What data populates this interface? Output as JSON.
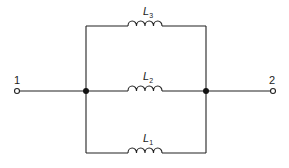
{
  "diagram": {
    "type": "parallel inductor circuit",
    "terminals": [
      {
        "id": "terminal-1",
        "label": "1"
      },
      {
        "id": "terminal-2",
        "label": "2"
      }
    ],
    "inductors": [
      {
        "name": "L",
        "sub": "3",
        "branch": "top"
      },
      {
        "name": "L",
        "sub": "2",
        "branch": "middle"
      },
      {
        "name": "L",
        "sub": "1",
        "branch": "bottom"
      }
    ],
    "colors": {
      "line": "#222222",
      "background": "#ffffff"
    }
  }
}
